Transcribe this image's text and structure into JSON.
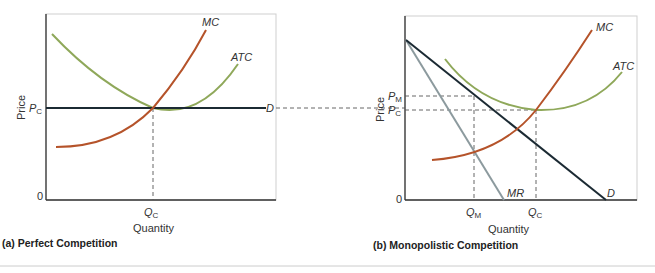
{
  "top_fragment": ", Q",
  "panel_a": {
    "caption": "(a)  Perfect Competition",
    "y_axis_label": "Price",
    "x_axis_label": "Quantity",
    "origin_label": "0",
    "price_label": "P",
    "price_sub": "C",
    "qty_label": "Q",
    "qty_sub": "C",
    "curves": {
      "mc": "MC",
      "atc": "ATC",
      "d": "D"
    }
  },
  "panel_b": {
    "caption": "(b)  Monopolistic Competition",
    "y_axis_label": "Price",
    "x_axis_label": "Quantity",
    "origin_label": "0",
    "pm_label": "P",
    "pm_sub": "M",
    "pc_label": "P",
    "pc_sub": "C",
    "qm_label": "Q",
    "qm_sub": "M",
    "qc_label": "Q",
    "qc_sub": "C",
    "curves": {
      "mc": "MC",
      "atc": "ATC",
      "d": "D",
      "mr": "MR"
    }
  },
  "colors": {
    "mc": "#b5532a",
    "atc": "#8fa85a",
    "demand": "#1b2a33",
    "mr": "#8c9a9e",
    "axis": "#333333",
    "dash": "#555555"
  }
}
